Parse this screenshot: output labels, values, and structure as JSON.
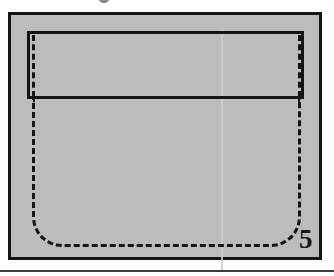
{
  "figure": {
    "number_label": "5",
    "caption": "",
    "background_color": "#bcbcbc",
    "line_color": "#141414",
    "page_background": "#ffffff",
    "fold_line_color": "#cfcfcf"
  },
  "diagram": {
    "type": "sewing-pattern-illustration",
    "frame": {
      "name": "outer-frame",
      "stroke": "#141414",
      "stroke_width_px": 3,
      "fill": "#bcbcbc"
    },
    "parts": [
      {
        "name": "flap",
        "style": "solid-outline",
        "stroke": "#141414",
        "description": "rectangular flap across the top of the pocket"
      },
      {
        "name": "flap-stitch-left",
        "style": "dashed",
        "stroke": "#141414",
        "description": "vertical stitch line inside the flap's left edge"
      },
      {
        "name": "flap-stitch-right",
        "style": "dashed",
        "stroke": "#141414",
        "description": "vertical stitch line inside the flap's right edge"
      },
      {
        "name": "pocket-body",
        "style": "dashed",
        "stroke": "#141414",
        "description": "stitched pocket outline with rounded bottom corners, open at the top"
      },
      {
        "name": "fold-line",
        "style": "faint-solid",
        "stroke": "#cfcfcf",
        "description": "subtle vertical crease down the middle of the fabric"
      }
    ]
  },
  "artifacts": {
    "top_mark": "partial-glyph-cut-off",
    "bottom_rule": "horizontal-divider-rule"
  }
}
